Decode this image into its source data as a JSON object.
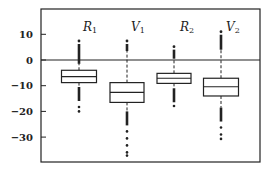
{
  "chart_data": {
    "type": "box",
    "title": "",
    "xlabel": "",
    "ylabel": "",
    "ylim": [
      -40,
      19
    ],
    "yticks": [
      10,
      0,
      -10,
      -20,
      -30
    ],
    "ytick_labels": [
      "10",
      "0",
      "−10",
      "−20",
      "−30"
    ],
    "reference_line": 0,
    "grid": false,
    "legend": null,
    "series": [
      {
        "name": "R1",
        "label_main": "R",
        "label_sub": "1",
        "q1": -8.8,
        "median": -6.5,
        "q3": -4.0,
        "whisker_low": -10.5,
        "whisker_high": -1.5,
        "outlier_high_max": 7.4,
        "outlier_low_min": -20.0
      },
      {
        "name": "V1",
        "label_main": "V",
        "label_sub": "1",
        "q1": -16.5,
        "median": -12.6,
        "q3": -8.8,
        "whisker_low": -20.0,
        "whisker_high": 3.5,
        "outlier_high_max": 7.4,
        "outlier_low_min": -37.2
      },
      {
        "name": "R2",
        "label_main": "R",
        "label_sub": "2",
        "q1": -9.1,
        "median": -7.1,
        "q3": -5.2,
        "whisker_low": -11.0,
        "whisker_high": 0.5,
        "outlier_high_max": 5.2,
        "outlier_low_min": -17.9
      },
      {
        "name": "V2",
        "label_main": "V",
        "label_sub": "2",
        "q1": -14.0,
        "median": -10.4,
        "q3": -7.1,
        "whisker_low": -18.5,
        "whisker_high": 4.0,
        "outlier_high_max": 11.0,
        "outlier_low_min": -30.7
      }
    ]
  },
  "colors": {
    "ink": "#222222",
    "background": "#ffffff"
  }
}
